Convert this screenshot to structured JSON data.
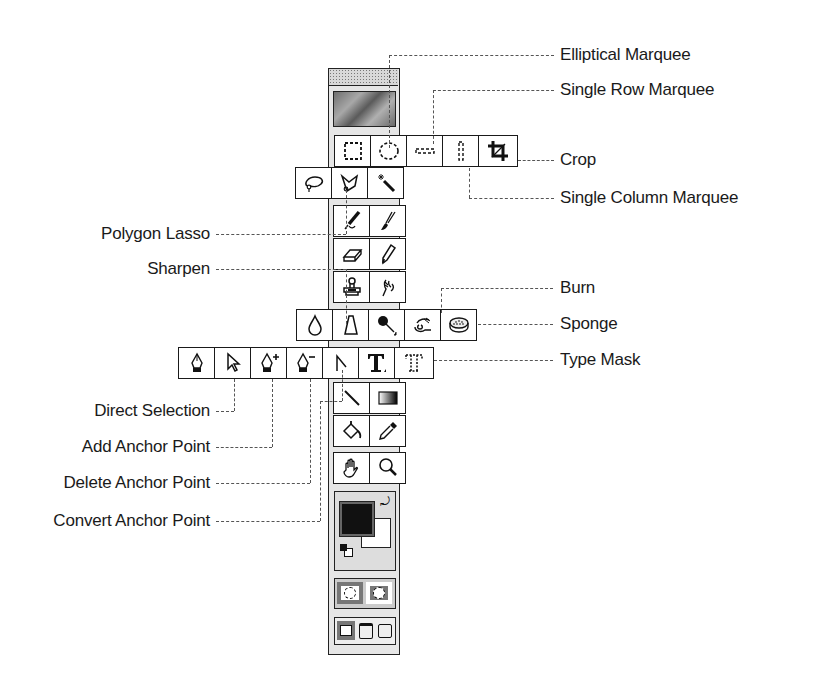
{
  "diagram": {
    "labels": {
      "elliptical_marquee": "Elliptical Marquee",
      "single_row_marquee": "Single Row Marquee",
      "crop": "Crop",
      "single_column_marquee": "Single Column Marquee",
      "polygon_lasso": "Polygon Lasso",
      "sharpen": "Sharpen",
      "burn": "Burn",
      "sponge": "Sponge",
      "type_mask": "Type Mask",
      "direct_selection": "Direct Selection",
      "add_anchor_point": "Add Anchor Point",
      "delete_anchor_point": "Delete Anchor Point",
      "convert_anchor_point": "Convert Anchor Point"
    },
    "toolbox": {
      "marquee_row": [
        "rectangular-marquee",
        "elliptical-marquee",
        "single-row-marquee",
        "single-column-marquee",
        "crop"
      ],
      "lasso_row": [
        "lasso",
        "polygon-lasso",
        "magic-wand"
      ],
      "paint_rows": [
        [
          "airbrush",
          "paintbrush"
        ],
        [
          "eraser",
          "pencil"
        ],
        [
          "rubber-stamp",
          "smudge"
        ]
      ],
      "focus_row": [
        "blur",
        "sharpen",
        "dodge",
        "burn",
        "sponge"
      ],
      "pen_row": [
        "pen",
        "direct-selection",
        "add-anchor-point",
        "delete-anchor-point",
        "convert-anchor-point",
        "type",
        "type-mask"
      ],
      "misc_rows": [
        [
          "line",
          "gradient"
        ],
        [
          "paint-bucket",
          "eyedropper"
        ],
        [
          "hand",
          "zoom"
        ]
      ],
      "colors": {
        "foreground": "#111111",
        "background": "#ffffff"
      },
      "mode_buttons": [
        "standard-mode",
        "quick-mask-mode"
      ],
      "screen_buttons": [
        "standard-screen",
        "full-screen-menubar",
        "full-screen"
      ]
    }
  }
}
